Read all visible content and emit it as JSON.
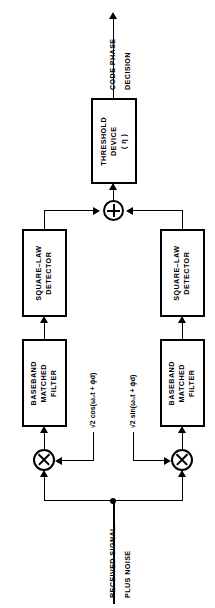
{
  "figure": {
    "orientation": "rotated-90-ccw",
    "line_color": "#000000",
    "background_color": "#ffffff"
  },
  "input": {
    "label_line1": "RECEIVED SIGNAL",
    "label_line2": "PLUS NOISE"
  },
  "output": {
    "label_line1": "CODE PHASE",
    "label_line2": "DECISION"
  },
  "local_oscillators": {
    "inphase": "√2 cos(ω₀t + ϕd)",
    "quadrature": "√2 sin(ω₀t + ϕd)"
  },
  "blocks": {
    "threshold": {
      "line1": "THRESHOLD",
      "line2": "DEVICE",
      "line3": "( η )"
    },
    "square_law_upper": {
      "line1": "SQUARE–LAW",
      "line2": "DETECTOR"
    },
    "square_law_lower": {
      "line1": "SQUARE–LAW",
      "line2": "DETECTOR"
    },
    "matched_filter_upper": {
      "line1": "BASEBAND",
      "line2": "MATCHED",
      "line3": "FILTER"
    },
    "matched_filter_lower": {
      "line1": "BASEBAND",
      "line2": "MATCHED",
      "line3": "FILTER"
    }
  },
  "operators": {
    "summer": "⊕",
    "multiplier_upper": "⊗",
    "multiplier_lower": "⊗"
  }
}
